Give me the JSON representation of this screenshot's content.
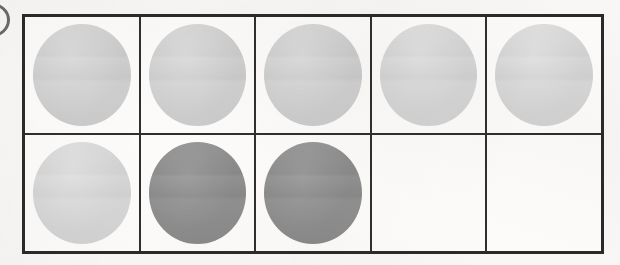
{
  "figure": {
    "grid_columns": 5,
    "grid_rows": 2,
    "background_color": "#f8f7f5",
    "border_color": "#2a2a2a"
  },
  "legend": {
    "light_fill_color": "#cdcdcd",
    "light_pale_fill_color": "#d4d4d4",
    "dark_fill_color": "#8b8b8b",
    "empty_label": ""
  },
  "edge_mark": {
    "name": "clipped-arc",
    "color": "#4a4a4a",
    "description": ""
  },
  "chart_data": {
    "type": "heatmap",
    "title": "",
    "xlabel": "",
    "ylabel": "",
    "rows": 2,
    "columns": 5,
    "cells": [
      {
        "row": 1,
        "column": 1,
        "state": "light",
        "fill": "#cdcdcd",
        "value": 1
      },
      {
        "row": 1,
        "column": 2,
        "state": "light",
        "fill": "#cdcdcd",
        "value": 1
      },
      {
        "row": 1,
        "column": 3,
        "state": "light",
        "fill": "#cdcdcd",
        "value": 1
      },
      {
        "row": 1,
        "column": 4,
        "state": "light-pale",
        "fill": "#d4d4d4",
        "value": 1
      },
      {
        "row": 1,
        "column": 5,
        "state": "light-pale",
        "fill": "#d4d4d4",
        "value": 1
      },
      {
        "row": 2,
        "column": 1,
        "state": "light-pale",
        "fill": "#d4d4d4",
        "value": 1
      },
      {
        "row": 2,
        "column": 2,
        "state": "dark",
        "fill": "#8b8b8b",
        "value": 2
      },
      {
        "row": 2,
        "column": 3,
        "state": "dark",
        "fill": "#8b8b8b",
        "value": 2
      },
      {
        "row": 2,
        "column": 4,
        "state": "empty",
        "fill": "",
        "value": 0
      },
      {
        "row": 2,
        "column": 5,
        "state": "empty",
        "fill": "",
        "value": 0
      }
    ]
  }
}
